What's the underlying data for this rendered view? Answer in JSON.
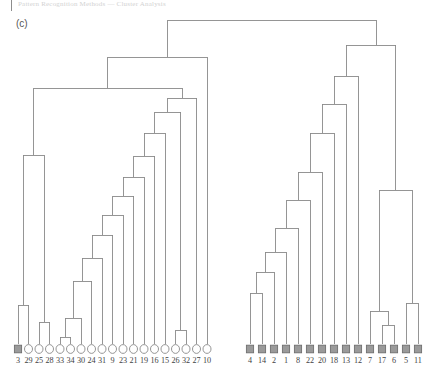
{
  "header": {
    "running_text": "Pattern Recognition Methods — Cluster Analysis"
  },
  "panel": {
    "label": "(c)"
  },
  "legend": {
    "open_marker_name": "open-circle-marker",
    "filled_marker_name": "filled-square-marker"
  },
  "colors": {
    "line": "#8a8a8a",
    "marker_fill": "#9a9a9a",
    "marker_stroke": "#6f6f6f",
    "open_stroke": "#8a8a8a",
    "text": "#3f3f3f",
    "background": "#ffffff"
  },
  "chart_data": {
    "type": "dendrogram",
    "title": "(c)",
    "xlabel": "",
    "ylabel": "",
    "orientation": "top-down",
    "grid": false,
    "legend_position": "none",
    "leaf_order": [
      "3",
      "29",
      "25",
      "28",
      "33",
      "34",
      "30",
      "24",
      "31",
      "9",
      "23",
      "21",
      "19",
      "16",
      "15",
      "26",
      "32",
      "27",
      "10",
      "4",
      "14",
      "2",
      "1",
      "8",
      "22",
      "20",
      "18",
      "13",
      "12",
      "7",
      "17",
      "6",
      "5",
      "11"
    ],
    "leaves": [
      {
        "label": "3",
        "x": 18,
        "marker": "square"
      },
      {
        "label": "29",
        "x": 28.5,
        "marker": "circle"
      },
      {
        "label": "25",
        "x": 39,
        "marker": "circle"
      },
      {
        "label": "28",
        "x": 49.5,
        "marker": "circle"
      },
      {
        "label": "33",
        "x": 60,
        "marker": "circle"
      },
      {
        "label": "34",
        "x": 70.5,
        "marker": "circle"
      },
      {
        "label": "30",
        "x": 81,
        "marker": "circle"
      },
      {
        "label": "24",
        "x": 91.5,
        "marker": "circle"
      },
      {
        "label": "31",
        "x": 102,
        "marker": "circle"
      },
      {
        "label": "9",
        "x": 112.5,
        "marker": "circle"
      },
      {
        "label": "23",
        "x": 123,
        "marker": "circle"
      },
      {
        "label": "21",
        "x": 133.5,
        "marker": "circle"
      },
      {
        "label": "19",
        "x": 144,
        "marker": "circle"
      },
      {
        "label": "16",
        "x": 154.5,
        "marker": "circle"
      },
      {
        "label": "15",
        "x": 165,
        "marker": "circle"
      },
      {
        "label": "26",
        "x": 175.5,
        "marker": "circle"
      },
      {
        "label": "32",
        "x": 186,
        "marker": "circle"
      },
      {
        "label": "27",
        "x": 196.5,
        "marker": "circle"
      },
      {
        "label": "10",
        "x": 207,
        "marker": "circle"
      },
      {
        "label": "4",
        "x": 250,
        "marker": "square"
      },
      {
        "label": "14",
        "x": 262,
        "marker": "square"
      },
      {
        "label": "2",
        "x": 274,
        "marker": "square"
      },
      {
        "label": "1",
        "x": 286,
        "marker": "square"
      },
      {
        "label": "8",
        "x": 298,
        "marker": "square"
      },
      {
        "label": "22",
        "x": 310,
        "marker": "square"
      },
      {
        "label": "20",
        "x": 322,
        "marker": "square"
      },
      {
        "label": "18",
        "x": 334,
        "marker": "square"
      },
      {
        "label": "13",
        "x": 346,
        "marker": "square"
      },
      {
        "label": "12",
        "x": 358,
        "marker": "square"
      },
      {
        "label": "7",
        "x": 370,
        "marker": "square"
      },
      {
        "label": "17",
        "x": 382,
        "marker": "square"
      },
      {
        "label": "6",
        "x": 394,
        "marker": "square"
      },
      {
        "label": "5",
        "x": 406,
        "marker": "square"
      },
      {
        "label": "11",
        "x": 418,
        "marker": "square"
      }
    ],
    "leaf_marker_y": 349,
    "merges": [
      {
        "id": "m1",
        "label": "33+34",
        "left": 60,
        "right": 70.5,
        "y": 337,
        "left_y": 344,
        "right_y": 344
      },
      {
        "id": "m2",
        "label": "(33,34)+30",
        "left": 65.2,
        "right": 81,
        "y": 318,
        "left_y": 337,
        "right_y": 344
      },
      {
        "id": "m3",
        "label": "25+28",
        "left": 39,
        "right": 49.5,
        "y": 322,
        "left_y": 344,
        "right_y": 344
      },
      {
        "id": "m4",
        "label": "26+32",
        "left": 175.5,
        "right": 186,
        "y": 330,
        "left_y": 344,
        "right_y": 344
      },
      {
        "id": "m5",
        "label": "3+29",
        "left": 18,
        "right": 28.5,
        "y": 305,
        "left_y": 344,
        "right_y": 344
      },
      {
        "id": "m6",
        "label": "m2+24",
        "left": 73.1,
        "right": 91.5,
        "y": 281,
        "left_y": 318,
        "right_y": 344
      },
      {
        "id": "m7",
        "label": "m6+31",
        "left": 82.3,
        "right": 102,
        "y": 258,
        "left_y": 281,
        "right_y": 344
      },
      {
        "id": "m8",
        "label": "m7+9",
        "left": 92.1,
        "right": 112.5,
        "y": 235,
        "left_y": 258,
        "right_y": 344
      },
      {
        "id": "m9",
        "label": "m8+23",
        "left": 102.3,
        "right": 123,
        "y": 215,
        "left_y": 235,
        "right_y": 344
      },
      {
        "id": "m10",
        "label": "m9+21",
        "left": 112.6,
        "right": 133.5,
        "y": 196,
        "left_y": 215,
        "right_y": 344
      },
      {
        "id": "m11",
        "label": "m10+19",
        "left": 123,
        "right": 144,
        "y": 177,
        "left_y": 196,
        "right_y": 344
      },
      {
        "id": "m12",
        "label": "m11+16",
        "left": 133.5,
        "right": 154.5,
        "y": 156,
        "left_y": 177,
        "right_y": 344
      },
      {
        "id": "m13",
        "label": "m12+15",
        "left": 144,
        "right": 165,
        "y": 133,
        "left_y": 156,
        "right_y": 344
      },
      {
        "id": "m14",
        "label": "m13+m4",
        "left": 154.5,
        "right": 180.7,
        "y": 112,
        "left_y": 133,
        "right_y": 330
      },
      {
        "id": "m15",
        "label": "m14+27",
        "left": 167.6,
        "right": 196.5,
        "y": 98,
        "left_y": 112,
        "right_y": 344
      },
      {
        "id": "m16",
        "label": "m3+m5",
        "left": 23.2,
        "right": 44.2,
        "y": 155,
        "left_y": 305,
        "right_y": 322
      },
      {
        "id": "m17",
        "label": "m16+m15",
        "left": 33.7,
        "right": 182,
        "y": 88,
        "left_y": 155,
        "right_y": 98
      },
      {
        "id": "m18",
        "label": "m17+10",
        "left": 107.8,
        "right": 207,
        "y": 57,
        "left_y": 88,
        "right_y": 344
      },
      {
        "id": "m19",
        "label": "4+14",
        "left": 250,
        "right": 262,
        "y": 293,
        "left_y": 344,
        "right_y": 344
      },
      {
        "id": "m20",
        "label": "m19+2",
        "left": 256,
        "right": 274,
        "y": 272,
        "left_y": 293,
        "right_y": 344
      },
      {
        "id": "m21",
        "label": "m20+1",
        "left": 265,
        "right": 286,
        "y": 252,
        "left_y": 272,
        "right_y": 344
      },
      {
        "id": "m22",
        "label": "m21+8",
        "left": 275.5,
        "right": 298,
        "y": 228,
        "left_y": 252,
        "right_y": 344
      },
      {
        "id": "m23",
        "label": "m22+22",
        "left": 286.8,
        "right": 310,
        "y": 200,
        "left_y": 228,
        "right_y": 344
      },
      {
        "id": "m24",
        "label": "m23+20",
        "left": 298.4,
        "right": 322,
        "y": 172,
        "left_y": 200,
        "right_y": 344
      },
      {
        "id": "m25",
        "label": "m24+18",
        "left": 310.2,
        "right": 334,
        "y": 133,
        "left_y": 172,
        "right_y": 344
      },
      {
        "id": "m26",
        "label": "m25+13",
        "left": 322.1,
        "right": 346,
        "y": 104,
        "left_y": 133,
        "right_y": 344
      },
      {
        "id": "m27",
        "label": "m26+12",
        "left": 334,
        "right": 358,
        "y": 76,
        "left_y": 104,
        "right_y": 344
      },
      {
        "id": "m28",
        "label": "17+6",
        "left": 382,
        "right": 394,
        "y": 325,
        "left_y": 344,
        "right_y": 344
      },
      {
        "id": "m29",
        "label": "m28+7",
        "left": 370,
        "right": 388,
        "y": 311,
        "left_y": 344,
        "right_y": 325
      },
      {
        "id": "m30",
        "label": "5+11",
        "left": 406,
        "right": 418,
        "y": 303,
        "left_y": 344,
        "right_y": 344
      },
      {
        "id": "m31",
        "label": "m29+m30",
        "left": 379,
        "right": 412,
        "y": 190,
        "left_y": 311,
        "right_y": 303
      },
      {
        "id": "m32",
        "label": "m27+m31",
        "left": 346,
        "right": 395.5,
        "y": 45,
        "left_y": 76,
        "right_y": 190
      },
      {
        "id": "root",
        "label": "root",
        "left": 167.7,
        "right": 376,
        "y": 20,
        "left_y": 57,
        "right_y": 45
      }
    ]
  }
}
